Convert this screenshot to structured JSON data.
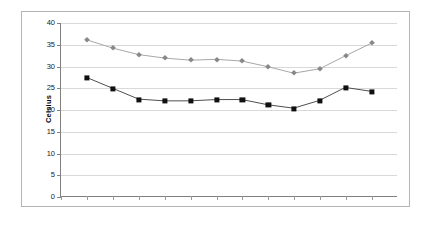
{
  "chart_data": {
    "type": "line",
    "title": "",
    "subtitle": "",
    "xlabel": "",
    "ylabel": "Celsius",
    "ylim": [
      0,
      40
    ],
    "ytick_step": 5,
    "yticks": [
      0,
      5,
      10,
      15,
      20,
      25,
      30,
      35,
      40
    ],
    "ytick_labels": [
      "0",
      "5",
      "10",
      "15",
      "20",
      "25",
      "30",
      "35",
      "40"
    ],
    "xticks_count": 13,
    "xtick_labels": [
      "",
      "",
      "",
      "",
      "",
      "",
      "",
      "",
      "",
      "",
      "",
      "",
      ""
    ],
    "grid": {
      "horizontal": true,
      "vertical": false,
      "color": "#d9d9d9"
    },
    "legend": {
      "visible": false,
      "position": "none",
      "entries": []
    },
    "annotations": [],
    "x": [
      1,
      2,
      3,
      4,
      5,
      6,
      7,
      8,
      9,
      10,
      11,
      12
    ],
    "series": [
      {
        "name": "upper-series",
        "marker": "diamond",
        "color": "#888888",
        "line_color": "#a6a6a6",
        "values": [
          36.1,
          34.2,
          32.7,
          31.9,
          31.4,
          31.6,
          31.2,
          29.9,
          28.4,
          29.4,
          32.4,
          35.3
        ]
      },
      {
        "name": "lower-series",
        "marker": "square",
        "color": "#101010",
        "line_color": "#4d4d4d",
        "values": [
          27.4,
          24.9,
          22.4,
          22.0,
          22.0,
          22.3,
          22.3,
          21.1,
          20.3,
          22.1,
          25.1,
          24.2
        ]
      }
    ]
  },
  "frame": {
    "border_color": "#b4b4b4",
    "background": "#ffffff"
  },
  "axis": {
    "line_color": "#808080",
    "tick_color": "#9a9a9a"
  }
}
